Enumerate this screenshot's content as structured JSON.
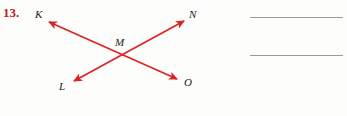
{
  "problem": {
    "number": "13.",
    "number_color": "#bb2222"
  },
  "figure": {
    "stroke_color": "#dd2222",
    "label_color": "#1a1a1a",
    "points": [
      {
        "id": "K",
        "label": "K",
        "x": 40,
        "y": 14
      },
      {
        "id": "N",
        "label": "N",
        "x": 193,
        "y": 14
      },
      {
        "id": "M",
        "label": "M",
        "x": 120,
        "y": 42
      },
      {
        "id": "L",
        "label": "L",
        "x": 63,
        "y": 86
      },
      {
        "id": "O",
        "label": "O",
        "x": 188,
        "y": 82
      }
    ],
    "lines": [
      {
        "id": "KO",
        "from": "K",
        "to": "O",
        "x1": 49,
        "y1": 22,
        "x2": 177,
        "y2": 79,
        "double_arrow": true
      },
      {
        "id": "LN",
        "from": "L",
        "to": "N",
        "x1": 74,
        "y1": 81,
        "x2": 184,
        "y2": 21,
        "double_arrow": true
      }
    ],
    "intersection": {
      "label": "M",
      "x": 122,
      "y": 53
    }
  },
  "answer_area": {
    "line_color": "#9a9a9a",
    "lines": [
      {
        "id": "answer-line-1",
        "value": ""
      },
      {
        "id": "answer-line-2",
        "value": ""
      }
    ]
  }
}
